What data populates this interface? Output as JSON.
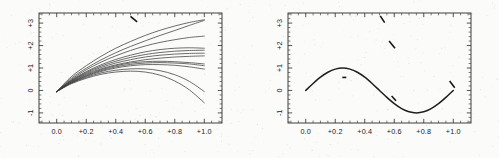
{
  "figure": {
    "name": "two-panel-curve-figure",
    "background_color": "#fbfbfa",
    "ink_color": "#2b2b2b"
  },
  "chart_data": [
    {
      "type": "line",
      "panel": "left",
      "title": "",
      "xlabel": "",
      "ylabel": "",
      "xlim": [
        -0.12,
        1.12
      ],
      "ylim": [
        -1.45,
        3.45
      ],
      "xticks": [
        0.0,
        0.2,
        0.4,
        0.6,
        0.8,
        1.0
      ],
      "xticklabels": [
        "0.0",
        "+0.2",
        "+0.4",
        "+0.6",
        "+0.8",
        "+1.0"
      ],
      "yticks": [
        -1,
        0,
        1,
        2,
        3
      ],
      "yticklabels": [
        "-1",
        "0",
        "+1",
        "+2",
        "+3"
      ],
      "grid": false,
      "legend": "none",
      "description": "Family of curves fanning out from a common origin near (0.0, -0.05); spread of endpoints at x=1.0 ranges from about -0.55 up to +3.15",
      "series": [
        {
          "name": "c1",
          "x": [
            0.0,
            0.1,
            0.2,
            0.3,
            0.4,
            0.5,
            0.6,
            0.7,
            0.8,
            0.9,
            1.0
          ],
          "values": [
            -0.05,
            0.62,
            1.1,
            1.52,
            1.88,
            2.18,
            2.45,
            2.68,
            2.87,
            3.03,
            3.15
          ]
        },
        {
          "name": "c2",
          "x": [
            0.0,
            0.1,
            0.2,
            0.3,
            0.4,
            0.5,
            0.6,
            0.7,
            0.8,
            0.9,
            1.0
          ],
          "values": [
            -0.05,
            0.55,
            0.99,
            1.36,
            1.68,
            1.96,
            2.21,
            2.45,
            2.67,
            2.9,
            3.12
          ]
        },
        {
          "name": "c3",
          "x": [
            0.0,
            0.1,
            0.2,
            0.3,
            0.4,
            0.5,
            0.6,
            0.7,
            0.8,
            0.9,
            1.0
          ],
          "values": [
            -0.05,
            0.5,
            0.92,
            1.26,
            1.54,
            1.78,
            1.98,
            2.14,
            2.26,
            2.36,
            2.42
          ]
        },
        {
          "name": "c4",
          "x": [
            0.0,
            0.1,
            0.2,
            0.3,
            0.4,
            0.5,
            0.6,
            0.7,
            0.8,
            0.9,
            1.0
          ],
          "values": [
            -0.05,
            0.46,
            0.84,
            1.14,
            1.38,
            1.57,
            1.72,
            1.82,
            1.88,
            1.9,
            1.88
          ]
        },
        {
          "name": "c5",
          "x": [
            0.0,
            0.1,
            0.2,
            0.3,
            0.4,
            0.5,
            0.6,
            0.7,
            0.8,
            0.9,
            1.0
          ],
          "values": [
            -0.05,
            0.44,
            0.8,
            1.08,
            1.3,
            1.47,
            1.6,
            1.69,
            1.75,
            1.78,
            1.79
          ]
        },
        {
          "name": "c6",
          "x": [
            0.0,
            0.1,
            0.2,
            0.3,
            0.4,
            0.5,
            0.6,
            0.7,
            0.8,
            0.9,
            1.0
          ],
          "values": [
            -0.05,
            0.42,
            0.76,
            1.02,
            1.22,
            1.37,
            1.49,
            1.57,
            1.62,
            1.65,
            1.66
          ]
        },
        {
          "name": "c7",
          "x": [
            0.0,
            0.1,
            0.2,
            0.3,
            0.4,
            0.5,
            0.6,
            0.7,
            0.8,
            0.9,
            1.0
          ],
          "values": [
            -0.05,
            0.4,
            0.72,
            0.96,
            1.14,
            1.27,
            1.37,
            1.44,
            1.49,
            1.52,
            1.54
          ]
        },
        {
          "name": "c8",
          "x": [
            0.0,
            0.1,
            0.2,
            0.3,
            0.4,
            0.5,
            0.6,
            0.7,
            0.8,
            0.9,
            1.0
          ],
          "values": [
            -0.05,
            0.38,
            0.68,
            0.92,
            1.1,
            1.22,
            1.28,
            1.3,
            1.28,
            1.24,
            1.18
          ]
        },
        {
          "name": "c9",
          "x": [
            0.0,
            0.1,
            0.2,
            0.3,
            0.4,
            0.5,
            0.6,
            0.7,
            0.8,
            0.9,
            1.0
          ],
          "values": [
            -0.05,
            0.36,
            0.65,
            0.88,
            1.05,
            1.16,
            1.22,
            1.24,
            1.22,
            1.18,
            1.1
          ]
        },
        {
          "name": "c10",
          "x": [
            0.0,
            0.1,
            0.2,
            0.3,
            0.4,
            0.5,
            0.6,
            0.7,
            0.8,
            0.9,
            1.0
          ],
          "values": [
            -0.05,
            0.34,
            0.62,
            0.84,
            1.0,
            1.1,
            1.15,
            1.15,
            1.12,
            1.05,
            0.95
          ]
        },
        {
          "name": "c11",
          "x": [
            0.0,
            0.1,
            0.2,
            0.3,
            0.4,
            0.5,
            0.6,
            0.7,
            0.8,
            0.9,
            1.0
          ],
          "values": [
            -0.05,
            0.33,
            0.58,
            0.78,
            0.9,
            0.96,
            0.96,
            0.88,
            0.7,
            0.4,
            -0.05
          ]
        },
        {
          "name": "c12",
          "x": [
            0.0,
            0.1,
            0.2,
            0.3,
            0.4,
            0.5,
            0.6,
            0.7,
            0.8,
            0.9,
            1.0
          ],
          "values": [
            -0.05,
            0.3,
            0.54,
            0.72,
            0.82,
            0.86,
            0.82,
            0.68,
            0.42,
            0.02,
            -0.55
          ]
        }
      ],
      "marks": [
        {
          "x1": 0.5,
          "y1": 3.3,
          "x2": 0.545,
          "y2": 3.05
        }
      ]
    },
    {
      "type": "line",
      "panel": "right",
      "title": "",
      "xlabel": "",
      "ylabel": "",
      "xlim": [
        -0.12,
        1.12
      ],
      "ylim": [
        -1.45,
        3.45
      ],
      "xticks": [
        0.0,
        0.2,
        0.4,
        0.6,
        0.8,
        1.0
      ],
      "xticklabels": [
        "0.0",
        "+0.2",
        "+0.4",
        "+0.6",
        "+0.8",
        "+1.0"
      ],
      "yticks": [
        -1,
        0,
        1,
        2,
        3
      ],
      "yticklabels": [
        "-1",
        "0",
        "+1",
        "+2",
        "+3"
      ],
      "grid": false,
      "legend": "none",
      "description": "Single heavy sinusoidal curve, sin(2*pi*x), peak +1 at x=0.25, zero crossing at x=0.5, trough -1 at x=0.75, returning to 0 at x=1.0; plus a few short isolated diagonal dash marks",
      "series": [
        {
          "name": "sine",
          "x": [
            0.0,
            0.05,
            0.1,
            0.15,
            0.2,
            0.25,
            0.3,
            0.35,
            0.4,
            0.45,
            0.5,
            0.55,
            0.6,
            0.65,
            0.7,
            0.75,
            0.8,
            0.85,
            0.9,
            0.95,
            1.0
          ],
          "values": [
            0.0,
            0.31,
            0.59,
            0.81,
            0.95,
            1.0,
            0.95,
            0.81,
            0.59,
            0.31,
            0.0,
            -0.31,
            -0.59,
            -0.81,
            -0.95,
            -1.0,
            -0.95,
            -0.81,
            -0.59,
            -0.31,
            0.0
          ]
        }
      ],
      "marks": [
        {
          "x1": 0.505,
          "y1": 3.32,
          "x2": 0.535,
          "y2": 3.02
        },
        {
          "x1": 0.565,
          "y1": 2.2,
          "x2": 0.605,
          "y2": 1.88
        },
        {
          "x1": 0.248,
          "y1": 0.58,
          "x2": 0.275,
          "y2": 0.58
        },
        {
          "x1": 0.582,
          "y1": -0.25,
          "x2": 0.612,
          "y2": -0.46
        },
        {
          "x1": 0.975,
          "y1": 0.42,
          "x2": 1.01,
          "y2": 0.12
        }
      ]
    }
  ]
}
